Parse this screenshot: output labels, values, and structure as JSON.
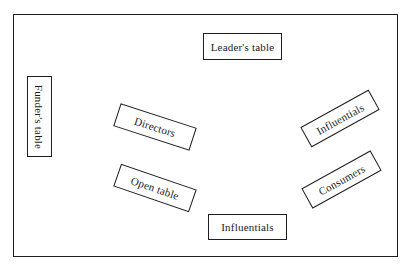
{
  "diagram": {
    "type": "room-seating-layout",
    "border_color": "#1e1e1e",
    "background": "#ffffff",
    "tables": [
      {
        "id": "leaders-table",
        "label": "Leader's table",
        "cx": 243,
        "cy": 47,
        "w": 79,
        "h": 27,
        "rotation": 0
      },
      {
        "id": "funders-table",
        "label": "Funder's table",
        "cx": 40,
        "cy": 117,
        "w": 81,
        "h": 25,
        "rotation": 0,
        "orientation": "vertical"
      },
      {
        "id": "directors-table",
        "label": "Directors",
        "cx": 155,
        "cy": 127,
        "w": 80,
        "h": 24,
        "rotation": 18
      },
      {
        "id": "open-table",
        "label": "Open table",
        "cx": 155,
        "cy": 188,
        "w": 80,
        "h": 24,
        "rotation": 19
      },
      {
        "id": "influentials-right-table",
        "label": "Influentials",
        "cx": 340,
        "cy": 118,
        "w": 78,
        "h": 23,
        "rotation": -29
      },
      {
        "id": "consumers-table",
        "label": "Consumers",
        "cx": 341,
        "cy": 179,
        "w": 79,
        "h": 23,
        "rotation": -29
      },
      {
        "id": "influentials-bottom-table",
        "label": "Influentials",
        "cx": 247,
        "cy": 227,
        "w": 79,
        "h": 26,
        "rotation": 0
      }
    ]
  }
}
